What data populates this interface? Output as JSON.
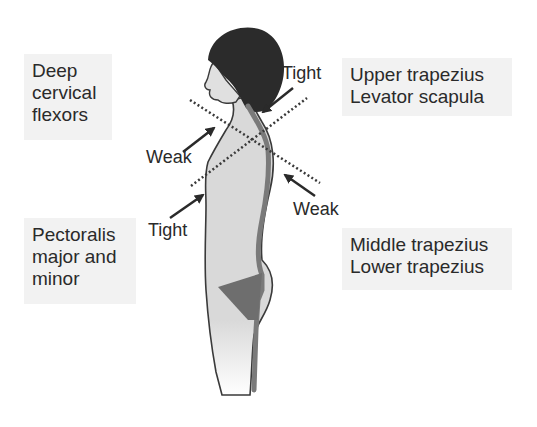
{
  "diagram": {
    "type": "upper crossed syndrome posture illustration",
    "muscle_boxes": {
      "deep_cervical_flexors": {
        "lines": [
          "Deep",
          "cervical",
          "flexors"
        ]
      },
      "upper_trapezius_levator": {
        "lines": [
          "Upper trapezius",
          "Levator scapula"
        ]
      },
      "pectoralis": {
        "lines": [
          "Pectoralis",
          "major and",
          "minor"
        ]
      },
      "middle_lower_trapezius": {
        "lines": [
          "Middle trapezius",
          "Lower trapezius"
        ]
      }
    },
    "arrow_labels": {
      "tight_upper": "Tight",
      "weak_front": "Weak",
      "weak_back": "Weak",
      "tight_lower": "Tight"
    },
    "colors": {
      "box_bg": "#f2f2f2",
      "body_fill": "#d9d9d9",
      "hair": "#2b2b2b",
      "spine": "#7a7a7a",
      "pelvis": "#6e6e6e",
      "outline": "#3a3a3a",
      "text": "#2a2a2a"
    }
  }
}
